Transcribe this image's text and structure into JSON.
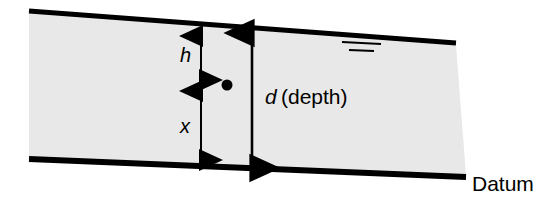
{
  "figure": {
    "background_color": "#ffffff",
    "fill_color": "#e8e8e8",
    "line_color": "#000000"
  },
  "labels": {
    "h": "h",
    "x": "x",
    "d_symbol": "d",
    "d_description": "(depth)",
    "datum": "Datum"
  },
  "annotations": {
    "water_surface_symbol": "water-table-symbol",
    "point_marker": "point-marker"
  },
  "geometry": {
    "channel_top_left": [
      29,
      11
    ],
    "channel_top_right": [
      456,
      43
    ],
    "channel_bottom_left": [
      29,
      158
    ],
    "channel_bottom_right": [
      466,
      177
    ],
    "dimension_line_hx_x": 201,
    "dimension_line_d_x": 252,
    "midpoint_y": 85
  }
}
